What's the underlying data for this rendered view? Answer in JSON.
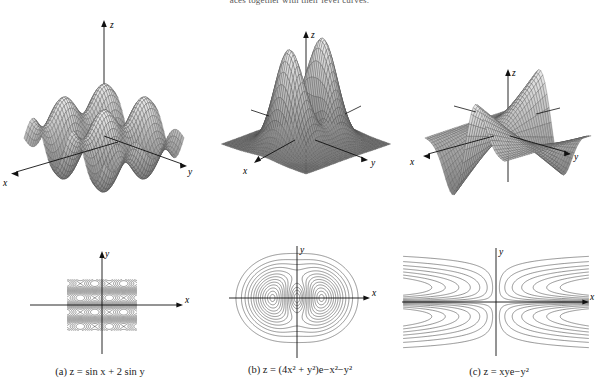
{
  "heading": {
    "text": "aces together with their level curves.",
    "clipped": true
  },
  "figure": {
    "kind": "math-textbook-figure",
    "layout": "3 columns x 2 rows (surface over contour)",
    "panels": [
      {
        "id": "a",
        "caption": "(a) z = sin x + 2 sin y",
        "equation_plain": "z = sin x + 2 sin y",
        "surface": {
          "type": "wireframe-surface",
          "axes": [
            "x",
            "y",
            "z"
          ],
          "axis_labels": {
            "x": "x",
            "y": "y",
            "z": "z"
          },
          "description": "periodic egg-carton surface, alternating ridges and valleys"
        },
        "contour": {
          "type": "contour",
          "axis_labels": {
            "x": "x",
            "y": "y"
          },
          "description": "periodic checkerboard of closed loops separated by wavy saddle bands"
        }
      },
      {
        "id": "b",
        "caption": "(b) z = (4x² + y²)e−x²−y²",
        "equation_plain": "z = (4x^2 + y^2)e^(-x^2-y^2)",
        "surface": {
          "type": "wireframe-surface",
          "axes": [
            "x",
            "y",
            "z"
          ],
          "axis_labels": {
            "x": "x",
            "y": "y",
            "z": "z"
          },
          "description": "twin symmetric peaks rising from a flat plane"
        },
        "contour": {
          "type": "contour",
          "axis_labels": {
            "x": "x",
            "y": "y"
          },
          "description": "two sets of nested ovals side by side inside large enclosing rings"
        }
      },
      {
        "id": "c",
        "caption": "(c) z = xye−y²",
        "equation_plain": "z = xy e^(-y^2)",
        "surface": {
          "type": "wireframe-surface",
          "axes": [
            "x",
            "y",
            "z"
          ],
          "axis_labels": {
            "x": "x",
            "y": "y",
            "z": "z"
          },
          "description": "saddle-like twisted sheet with opposing ridges and troughs"
        },
        "contour": {
          "type": "contour",
          "axis_labels": {
            "x": "x",
            "y": "y"
          },
          "description": "nested U-shaped curves opening left and right, mirrored about both axes"
        }
      }
    ]
  },
  "chart_data": {
    "type": "line",
    "xlabel": "x",
    "ylabel": "y",
    "grid": false,
    "legend": "none",
    "charts": [
      {
        "id": "a",
        "equation": "z = sin x + 2 sin y",
        "surface_z_range": [
          -3,
          3
        ],
        "domain_x": [
          -6.28,
          6.28
        ],
        "domain_y": [
          -6.28,
          6.28
        ],
        "contour_levels": [
          -2.5,
          -2,
          -1.5,
          -1,
          -0.5,
          0,
          0.5,
          1,
          1.5,
          2,
          2.5
        ],
        "critical_points": "maxima near (pi/2, pi/2), minima near (-pi/2, -pi/2)"
      },
      {
        "id": "b",
        "equation": "z = (4x^2 + y^2)e^(-x^2-y^2)",
        "surface_z_range": [
          0,
          1.5
        ],
        "domain_x": [
          -2.5,
          2.5
        ],
        "domain_y": [
          -2.5,
          2.5
        ],
        "contour_levels": [
          0.1,
          0.2,
          0.3,
          0.45,
          0.6,
          0.75,
          0.9,
          1.05,
          1.2,
          1.35
        ],
        "critical_points": "two maxima at (±1, 0), saddle at origin"
      },
      {
        "id": "c",
        "equation": "z = xy e^(-y^2)",
        "surface_z_range": [
          -1.2,
          1.2
        ],
        "domain_x": [
          -2.5,
          2.5
        ],
        "domain_y": [
          -2.5,
          2.5
        ],
        "contour_levels": [
          -0.8,
          -0.6,
          -0.4,
          -0.2,
          0.2,
          0.4,
          0.6,
          0.8
        ],
        "critical_points": "saddle along x = 0 and y = 0 axes"
      }
    ]
  }
}
